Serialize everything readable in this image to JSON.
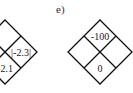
{
  "label": "e)",
  "diagrams": [
    {
      "name": "left-diamond",
      "cells": {
        "top": "",
        "right": "|-2.3|",
        "bottom": "-2.1",
        "left": ""
      }
    },
    {
      "name": "right-diamond",
      "cells": {
        "top": "-100",
        "right": "",
        "bottom": "0",
        "left": ""
      }
    }
  ]
}
